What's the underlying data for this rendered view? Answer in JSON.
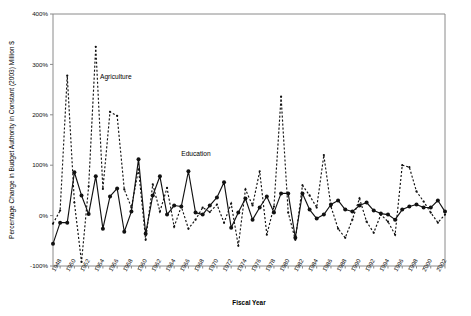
{
  "chart_data": {
    "type": "line",
    "title": "",
    "xlabel": "Fiscal Year",
    "ylabel": "Percentage Change in Budget Authority in Constant (2003) Million $",
    "ylim": [
      -100,
      400
    ],
    "yticks": [
      "-100%",
      "0%",
      "100%",
      "200%",
      "300%",
      "400%"
    ],
    "ytick_values": [
      -100,
      0,
      100,
      200,
      300,
      400
    ],
    "xlim": [
      1948,
      2003
    ],
    "xticks": [
      "1948",
      "1950",
      "1952",
      "1954",
      "1956",
      "1958",
      "1960",
      "1962",
      "1964",
      "1966",
      "1968",
      "1970",
      "1972",
      "1974",
      "1976",
      "1978",
      "1980",
      "1982",
      "1984",
      "1986",
      "1988",
      "1990",
      "1992",
      "1994",
      "1996",
      "1998",
      "2000",
      "2002"
    ],
    "xtick_values": [
      1948,
      1950,
      1952,
      1954,
      1956,
      1958,
      1960,
      1962,
      1964,
      1966,
      1968,
      1970,
      1972,
      1974,
      1976,
      1978,
      1980,
      1982,
      1984,
      1986,
      1988,
      1990,
      1992,
      1994,
      1996,
      1998,
      2000,
      2002
    ],
    "grid": false,
    "legend_position": "inline-annotations",
    "annotations": [
      {
        "text": "Agriculture",
        "x": 1954.6,
        "y": 272
      },
      {
        "text": "Education",
        "x": 1966.0,
        "y": 118
      }
    ],
    "x": [
      1948,
      1949,
      1950,
      1951,
      1952,
      1953,
      1954,
      1955,
      1956,
      1957,
      1958,
      1959,
      1960,
      1961,
      1962,
      1963,
      1964,
      1965,
      1966,
      1967,
      1968,
      1969,
      1970,
      1971,
      1972,
      1973,
      1974,
      1975,
      1976,
      1977,
      1978,
      1979,
      1980,
      1981,
      1982,
      1983,
      1984,
      1985,
      1986,
      1987,
      1988,
      1989,
      1990,
      1991,
      1992,
      1993,
      1994,
      1995,
      1996,
      1997,
      1998,
      1999,
      2000,
      2001,
      2002,
      2003
    ],
    "series": [
      {
        "name": "Agriculture",
        "style": "dashed",
        "marker": "small-dot",
        "values": [
          -16,
          10,
          278,
          26,
          -92,
          58,
          335,
          53,
          206,
          198,
          52,
          16,
          92,
          -48,
          62,
          8,
          55,
          -22,
          18,
          -26,
          -8,
          16,
          7,
          22,
          -14,
          24,
          -60,
          52,
          20,
          88,
          -38,
          18,
          236,
          6,
          -48,
          60,
          40,
          16,
          120,
          18,
          -26,
          -44,
          -8,
          34,
          -12,
          -34,
          2,
          -12,
          -38,
          100,
          96,
          48,
          28,
          6,
          -14,
          2
        ]
      },
      {
        "name": "Education",
        "style": "solid",
        "marker": "filled-circle",
        "values": [
          -56,
          -14,
          -14,
          86,
          40,
          3,
          78,
          -26,
          38,
          54,
          -32,
          8,
          112,
          -36,
          40,
          78,
          2,
          20,
          18,
          88,
          6,
          2,
          20,
          36,
          66,
          -24,
          6,
          34,
          -8,
          16,
          38,
          6,
          44,
          44,
          -44,
          44,
          12,
          -6,
          2,
          22,
          30,
          12,
          8,
          20,
          26,
          10,
          4,
          2,
          -8,
          12,
          18,
          22,
          16,
          16,
          30,
          8
        ]
      }
    ]
  },
  "axis": {
    "x_title": "Fiscal Year",
    "y_title": "Percentage Change in Budget Authority in Constant (2003) Million $"
  }
}
